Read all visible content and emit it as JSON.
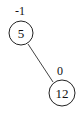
{
  "diagram": {
    "type": "avl-tree",
    "nodes": [
      {
        "id": "n5",
        "value": "5",
        "balance": "-1",
        "cx": 21,
        "cy": 33,
        "r": 12
      },
      {
        "id": "n12",
        "value": "12",
        "balance": "0",
        "cx": 62,
        "cy": 93,
        "r": 13
      }
    ],
    "edges": [
      {
        "from": "n5",
        "to": "n12",
        "side": "right"
      }
    ],
    "colors": {
      "stroke": "#222222",
      "background": "#ffffff"
    }
  }
}
